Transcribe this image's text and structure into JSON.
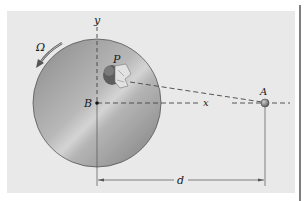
{
  "figure": {
    "labels": {
      "omega": "Ω",
      "y_axis": "y",
      "x_axis": "x",
      "point_p": "P",
      "point_b": "B",
      "point_a": "A",
      "distance": "d"
    },
    "colors": {
      "panel_bg": "#e9e9e9",
      "disc_dark": "#8e8e8e",
      "disc_light": "#d2d2d2",
      "line": "#333333",
      "dash": "#444444"
    }
  }
}
